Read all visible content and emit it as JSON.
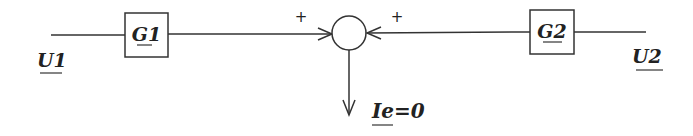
{
  "diagram": {
    "type": "summing-junction block diagram",
    "blocks": [
      {
        "id": "G1",
        "label": "G1"
      },
      {
        "id": "G2",
        "label": "G2"
      }
    ],
    "inputs": [
      {
        "id": "U1",
        "label": "U1"
      },
      {
        "id": "U2",
        "label": "U2"
      }
    ],
    "junction": {
      "signs": [
        "+",
        "+"
      ]
    },
    "output": {
      "label": "Ie=0"
    },
    "colors": {
      "stroke": "#333333",
      "text": "#222222",
      "background": "#ffffff"
    }
  }
}
